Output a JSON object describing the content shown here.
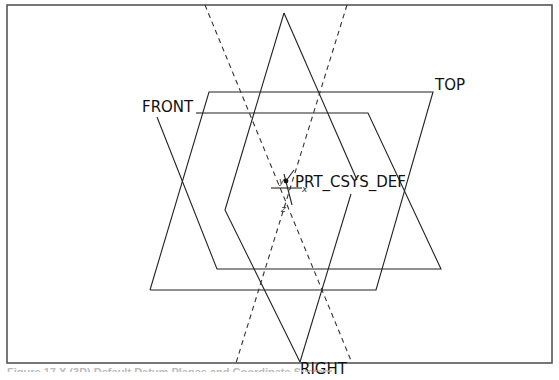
{
  "diagram": {
    "labels": {
      "front": "FRONT",
      "top": "TOP",
      "right": "RIGHT",
      "csys": "PRT_CSYS_DEF"
    },
    "axis_labels": {
      "x": "x",
      "y": "y",
      "z": "z"
    },
    "caption": "Figure 17.X  (3D) Default Datum Planes and Coordinate System"
  }
}
